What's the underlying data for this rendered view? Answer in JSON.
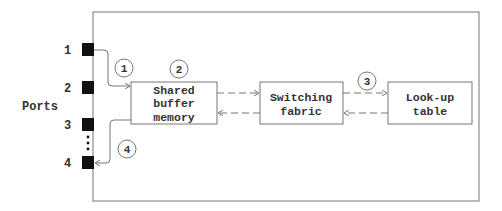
{
  "diagram": {
    "side_label": "Ports",
    "ports": [
      {
        "label": "1",
        "y": 50
      },
      {
        "label": "2",
        "y": 88
      },
      {
        "label": "3",
        "y": 125
      },
      {
        "label": "4",
        "y": 163
      }
    ],
    "ellipsis": "⋮",
    "boxes": {
      "buffer": [
        "Shared",
        "buffer",
        "memory"
      ],
      "fabric": [
        "Switching",
        "fabric"
      ],
      "lookup": [
        "Look-up",
        "table"
      ]
    },
    "steps": [
      {
        "label": "1",
        "x": 124,
        "y": 68
      },
      {
        "label": "2",
        "x": 179,
        "y": 69
      },
      {
        "label": "3",
        "x": 367,
        "y": 81
      },
      {
        "label": "4",
        "x": 127,
        "y": 149
      }
    ],
    "colors": {
      "line": "#777777",
      "port": "#111111",
      "text": "#333333"
    }
  }
}
